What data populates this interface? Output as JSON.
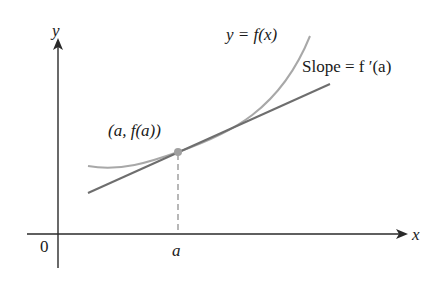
{
  "figure": {
    "colors": {
      "axes": "#2a2a2a",
      "curve": "#a8a8a8",
      "tangent": "#6e6e6e",
      "point": "#a0a0a0",
      "dashed": "#9a9a9a",
      "text": "#1a1a1a"
    },
    "labels": {
      "y_axis": "y",
      "x_axis": "x",
      "origin": "0",
      "a_tick": "a",
      "curve": "y = f(x)",
      "slope": "Slope = f ′(a)",
      "point": "(a, f(a))"
    }
  }
}
